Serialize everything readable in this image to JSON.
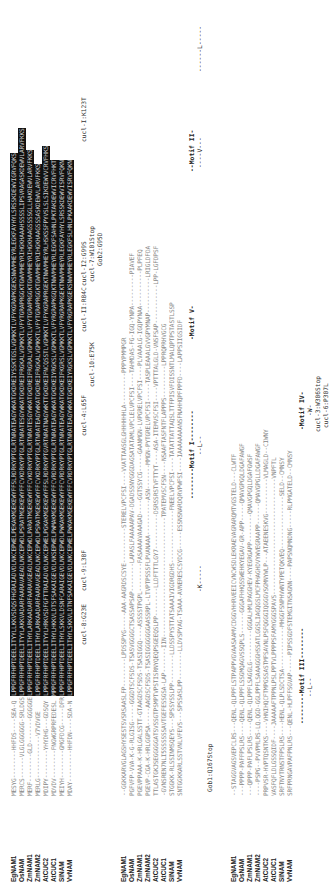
{
  "figure": {
    "orientation": "rotated -90deg",
    "species": [
      "EgNAM1",
      "OsNAM",
      "ZmNAM1",
      "ZmNAM2",
      "AtCUC2",
      "AtCUC1",
      "SlNAM",
      "VvNAM"
    ],
    "block1": {
      "pre": [
        "MESYG--------HHFDS----SEA-Q",
        "MERCS------VLGLGGGGGG-SRLDGS",
        "MERF--------GLD-------GGGGGE",
        "MERLG------------V7VDVGE",
        "MDIPY--------YHYDHG---GDSQY",
        "MDVDV--------FNGWGRPRFEDESL",
        "MEIYH--------GMGFDCG-----DFR",
        "MDAY---------HHFDN----SDA-N"
      ],
      "hl": [
        "LPPGFRFHPTDEELITYYLLKKVSDQSFHGRAIADVDLNKCEPWELPEKAKMGEKEWYFFSLRDRKYPTGLRTNRATEAGYWKATGKDREIYSSKTGSLVGMKKTLVFYKGRAPKGEKSNWVMHEYRLEGKFAYHYLSRSSKDEWVIGRVFQKS",
        "LPPGFRFHPTDEELITYYLAKKVADARFAARAVAEADLNKCEPWDLPSRATMGEKEWYFFCVKDRKYPTGLRTNRATESGYWKATGKDREIFRGKALVGMKKTLVFYTGRAPRGGKTGWVMHEYRIHGKHAAAHSSSSLIPSVRAGASKDEWVLARVFKKS",
        "LPPGFRFHPTDEELITHYLARKAADARFAARAVGEADLNKCEPWDLPARATMGEKEWYFFCVKDRKYPTGLRTNRATESGYWKATGKDREIFRGRALVGMKKTLVFYTGRAPRGGKTGWVMHEYRIHGKHAAGSSSSGLLHAKDEWVLARVFKKS",
        "LPPGFRFHPTDEELITHYLARKAADARFAARAVGEADLNKCEPWDLPSRATMGEKEWYFFCVKDRKYPTGLRTNRATEAGYWKATGKDREIFRGKALVGMKKTLVFYTGRAPRGGKTGWVMHEYRIHGKHAAGSSSASKDEWVLARVFKKS",
        "LPPGFRFHPTDEELITYYLHRKVSDFGFTTRAIADVDLNKCEPWELPGKAKMGEKEWYFFSLRDRKYPTGVRTNRATNAGYWKTTGKDKEIFNCQSSTLVGMKKTLVFYKGRAPRGEKTNWVMHEYRLHSKSSFPYVSLSLSIKDEWVVCRVFHKS",
        "MPPGFRFHPTDEELITHYLHKKVLDTSFSAKAIGEVDLNKSEPWELPWMAKMGEKEWYFFCVRDRKYPTGLRTNRATEAGYWKATGKDKEIYRGKSLVGMKKTLVFYRGRAPKGQKTNWVMHEYRLEGKFSAHNLPKTAKDEWVICRVFHKT",
        "LPPGFRFHPTDEELITHYLSKKVLDSNFCARAIGEVDLNKCEPWDLPWKAKMGEKEWYFFCVRDRKYPTGLRTNRATEAGYWKATGKDKEIFKGRSLVGMKKTLVFYRGRAPKGEKTNWVMHEYRLEGKFAYHYLSRSSKDEWVISRVFQKN",
        "LPPGFRFHPTDEELITHYLSKKVLDTNFSAKAIGEVDLNKCEPWELPWKAKMGEKEWYFFCVRDRKYPTGLRTNRATEAGYWKATGKDKEIYRGKSLVGMKKTLVFYRGRAPKGEKSNWVMHEYRLEGKFSLHNLPKAAKDEWVISRVFQKN"
      ],
      "mutations_row1": [
        {
          "label": "cucl-8:G23E"
        },
        {
          "label": "cucl-9:L38F"
        },
        {
          "label": "cucl-4:L65F"
        },
        {
          "label": "cucl-II:R84C"
        },
        {
          "label": "cucl-I2:G99S"
        },
        {
          "label": "cucl-I:K123T"
        }
      ],
      "mutations_row2": [
        {
          "label": "cucl-10:E75K"
        },
        {
          "label": "cucl-7:W101Stop"
        }
      ],
      "mutations_row3": [
        {
          "label": "Gob2:G95D"
        }
      ]
    },
    "block2": {
      "post": [
        "--GGKKARVGLAGSHYSESTSVSRSAASLFP--------LPDSSPYG-----AAA-AAGRDSCSYE----------STERELVPCFSI----VVATTAASGLGHHHHHHLA---------PPPYPMMPGR",
        "PGFVFP-VVA-K-G-RLGISG-----GGGDTSCFSDS-TSASVGGGGCTSASSAPSAP--------LAPASLFAAAAAPAV-DGADSSNYGGGDAGSATATAMLVPCLELVPCFSI----TAHMDAS-FG-IGQ-YNPA---------PIAVEF",
        "PGEVPPAAA-K-HRLGALSSTT-GTAAGDSCFSDS-TSASIGGQ----ASSSSTPGPL--------FASAAAAVAAAGAD----GGTSSYCG-----GAANMGN-LVPGRELVPCFSI----PLVAAALG-IGQPYNAA----------PLPFEQ",
        "PGEVP-CGA-K-HRLGGPSA-----AAGDSCFSDS-TSASIGGGGGGGAASSRPL-LTVPTPSSSFLPVANAAA----------ASN-------MMGN-PYTGRELVPCFSI-----TASPLEAAALGVVGPYMNAP----------LRIGLDFDA",
        "TTLASTGKJSEGGGGGATSVSSGTPSMPTVPSTISRNYQEQPSGEEQSLPP--------LLDFTTTLGY7----------DSRSSRSTVFTTYT----ASA-ITEMVSCFSI----VPTTTALGLD-VNSFSAP-----------LPP-LGFDPSF",
        "-GVNSREN7NLI5SSSSSSAVTGEFESSGSA-LAP-------IIN----------------------------------TPATEMVSCFSN----NSAAFTASFNTFLAPPPS---------LPPRQPRHVGCG",
        "STGGKK-RLSSINMSQEYS---SPSSYSSLPP--------LLDSSPYSTTATSAAAIVIGDRGDHS---------------FNEELVPCFSI----TATATTATTAQSLTTFPISVFDISSNTLMALQPTPSTASTLSSP",
        "SNTGGKKARLSSTVNLVFEVS---SPSSASLPP--------LLDVSPYAG-TSAAA-AVNERESCSYDCG-----ESSNSNARDQRVPWFSI----IAAAAAAAANSFNAHHQPFPPFD----LAPPSIIGSIDF"
      ],
      "motifs": [
        {
          "label": "--------Motif I--------"
        },
        {
          "label": "-Motif V-"
        },
        {
          "label": "--Motif II-"
        }
      ],
      "subs": [
        {
          "label": "-K-----"
        },
        {
          "label": "--L--"
        },
        {
          "label": "----V---"
        },
        {
          "label": "------L-----"
        }
      ],
      "gob": {
        "label": "Gob1:Q167Stop"
      }
    },
    "block3": {
      "seq": [
        "--STAGGVAGSVEPCLRS---QENL-QLPPFLSTPAPPVGVAASAAMVCDGGVHHRVEEICVNCWSDLEKRAEVAGRARQMTVGSTELD---CLWTF",
        "---PPPP-PAFFPSLRS----QENL-QLPPFLSSGMQAGVSSQPLS------GGGAFHHQSSWEHKYEGAV-GR-APP-----QMAVGPGQLDGAFAWGF",
        "---QPPP-PAFLPSLRS----QENL-QLPPFLSAGGLG---------GGGALHMLPAGGHEV-KYEGRGAPP--------QMAVGPGQLDGAFGWSF",
        "----PSPG--PVVPMLRS-LQ.QGD-GGLPPFLSAAAGGGHSSATLGGSLIAGQGSLMCFPHAGHDVYWVEGRAAPP------QMAVGPGLLDGAFAWGF",
        "PRPVSR-HVPTQSNTKS----VHNIHQCFTMPGSSASTMFSAVNLPSFQGGGIQGGGVSGMNYWLP---ATAEENESKVG----------VLMAGLD--CIWNY",
        "VASFQFLDLGSSQIDF----JAAAAAFTPPNLPSLPPTVLPPPPSFAMYGGGSPAVS---------------------------------VNPFTL",
        "SRFTNYTRNSTFPSLRS----HENL-QLPLSDCTSA------------MHGGFSNPHVWNTYPETQKVEQ---------------SELD--CMNSY",
        "SRFPRNGAVPAFPNLRS---QENL-HLPFFSGVAP-----PIPSSGDFSTEMGITNSAGNN----PAPSNQMNDNG-----RLPMGATELD--CMNSY"
      ],
      "motifs": [
        {
          "label": "--------Motif III--------"
        },
        {
          "label": "-Motif IV-"
        }
      ],
      "subs": [
        {
          "label": "--L--"
        },
        {
          "label": "-W-"
        }
      ],
      "mutations": [
        {
          "label": "cucl-3:W306Stop"
        },
        {
          "label": "cucl-6:P307L"
        }
      ]
    }
  }
}
